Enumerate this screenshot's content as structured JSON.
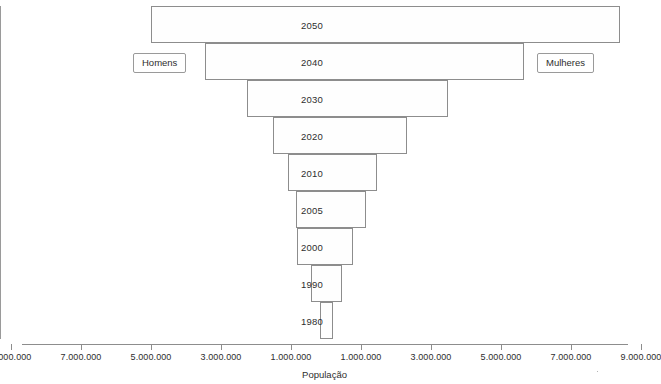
{
  "chart_data": {
    "type": "bar",
    "title": "",
    "xlabel": "População",
    "ylabel": "",
    "categories": [
      "2050",
      "2040",
      "2030",
      "2020",
      "2010",
      "2005",
      "2000",
      "1990",
      "1980"
    ],
    "series": [
      {
        "name": "Homens",
        "side": "left",
        "values": [
          5000000,
          3450000,
          2260000,
          1510000,
          1090000,
          860000,
          830000,
          430000,
          170000
        ]
      },
      {
        "name": "Mulheres",
        "side": "right",
        "values": [
          8400000,
          5660000,
          3490000,
          2310000,
          1460000,
          1140000,
          770000,
          460000,
          200000
        ]
      }
    ],
    "xlim": [
      -9000000,
      9000000
    ],
    "x_tick_values": [
      -9000000,
      -7000000,
      -5000000,
      -3000000,
      -1000000,
      1000000,
      3000000,
      5000000,
      7000000,
      9000000
    ],
    "x_tick_labels": [
      "9.000.000",
      "7.000.000",
      "5.000.000",
      "3.000.000",
      "1.000.000",
      "1.000.000",
      "3.000.000",
      "5.000.000",
      "7.000.000",
      "9.000.000"
    ],
    "grid": false,
    "legend_position": "inside-row-2040",
    "orientation": "horizontal-diverging",
    "bar_fill_color": "#fefefe",
    "bar_border_color": "#8d8d8d",
    "axis_color": "#8d8d8d",
    "text_color": "#2e2e2e"
  },
  "legend": {
    "left_label": "Homens",
    "right_label": "Mulheres"
  },
  "axis": {
    "title": "População"
  }
}
